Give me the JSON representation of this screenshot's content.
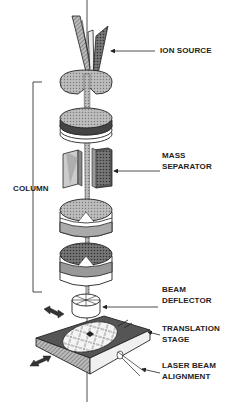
{
  "diagram": {
    "labels": {
      "ion_source": "ION SOURCE",
      "column": "COLUMN",
      "mass_separator_1": "MASS",
      "mass_separator_2": "SEPARATOR",
      "beam_deflector_1": "BEAM",
      "beam_deflector_2": "DEFLECTOR",
      "translation_stage_1": "TRANSLATION",
      "translation_stage_2": "STAGE",
      "laser_beam_alignment_1": "LASER BEAM",
      "laser_beam_alignment_2": "ALIGNMENT"
    },
    "components": [
      {
        "name": "ion-source",
        "y": 40
      },
      {
        "name": "lens-1",
        "y": 80
      },
      {
        "name": "lens-2",
        "y": 125
      },
      {
        "name": "mass-separator",
        "y": 190
      },
      {
        "name": "lens-3",
        "y": 245
      },
      {
        "name": "lens-4",
        "y": 285
      },
      {
        "name": "beam-deflector",
        "y": 325
      },
      {
        "name": "translation-stage",
        "y": 375
      }
    ],
    "colors": {
      "line": "#222222",
      "gray_light": "#c8c8c8",
      "gray_mid": "#9a9a9a",
      "gray_dark": "#555555",
      "background": "#ffffff"
    }
  }
}
